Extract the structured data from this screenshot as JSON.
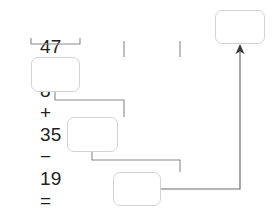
{
  "problem": {
    "equation_text": "47 − 8 + 35 − 19 =",
    "terms": [
      "47",
      "8",
      "35",
      "19"
    ],
    "operators": [
      "−",
      "+",
      "−"
    ],
    "equals_sign": "=",
    "tokens": [
      {
        "text": "47",
        "type": "number"
      },
      {
        "text": "−",
        "type": "operator"
      },
      {
        "text": "8",
        "type": "number"
      },
      {
        "text": "+",
        "type": "operator"
      },
      {
        "text": "35",
        "type": "number"
      },
      {
        "text": "−",
        "type": "operator"
      },
      {
        "text": "19",
        "type": "number"
      },
      {
        "text": "=",
        "type": "equals"
      }
    ]
  },
  "boxes": {
    "step1": {
      "value": "",
      "placeholder": "",
      "label": "first step answer box"
    },
    "step2": {
      "value": "",
      "placeholder": "",
      "label": "second step answer box"
    },
    "step3": {
      "value": "",
      "placeholder": "",
      "label": "third step answer box"
    },
    "result": {
      "value": "",
      "placeholder": "",
      "label": "final result box"
    }
  },
  "colors": {
    "text": "#231f20",
    "box_border": "#d3d3d5",
    "wire": "#8a8a8e",
    "arrow": "#3a3a3c",
    "background": "#ffffff"
  }
}
